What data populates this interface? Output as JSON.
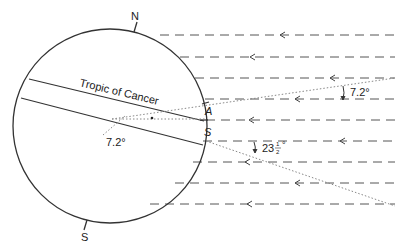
{
  "diagram": {
    "type": "earth-sun-rays",
    "labels": {
      "north": "N",
      "south": "S",
      "tropic": "Tropic of Cancer",
      "arc_a": "A",
      "arc_s": "S",
      "angle_center": "7.2°",
      "angle_upper": "7.2°",
      "angle_lower_whole": "23",
      "angle_lower_num": "1",
      "angle_lower_den": "2",
      "angle_lower_deg": "°"
    },
    "rays": {
      "count": 9,
      "direction": "right-to-left",
      "y_positions": [
        35,
        57,
        78,
        99,
        120,
        141,
        162,
        183,
        204
      ],
      "arrow_x": [
        280,
        250,
        330,
        280,
        250,
        340,
        250,
        295,
        250
      ]
    },
    "colors": {
      "line": "#333333",
      "ray": "#555555",
      "dotted": "#888888"
    }
  }
}
